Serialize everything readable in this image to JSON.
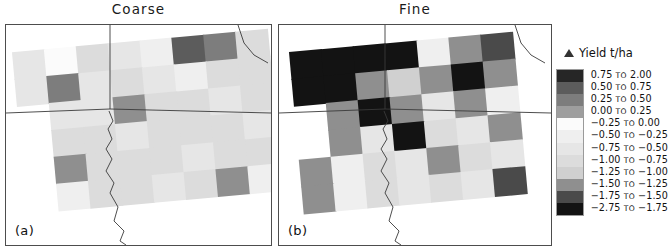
{
  "figure": {
    "panels": [
      {
        "id": "a",
        "title": "Coarse",
        "corner_label": "(a)"
      },
      {
        "id": "b",
        "title": "Fine",
        "corner_label": "(b)"
      }
    ]
  },
  "legend": {
    "symbol": "delta-triangle-icon",
    "title": "Yield t/ha",
    "separator": "to",
    "entries": [
      {
        "label": "0.75 to 2.00",
        "from": "0.75",
        "to": "2.00",
        "color": "#262626"
      },
      {
        "label": "0.50 to 0.75",
        "from": "0.50",
        "to": "0.75",
        "color": "#5c5c5c"
      },
      {
        "label": "0.25 to 0.50",
        "from": "0.25",
        "to": "0.50",
        "color": "#7d7d7d"
      },
      {
        "label": "0.00 to 0.25",
        "from": "0.00",
        "to": "0.25",
        "color": "#9e9e9e"
      },
      {
        "label": "-0.25 to 0.00",
        "from": "-0.25",
        "to": "0.00",
        "color": "#fbfbfb"
      },
      {
        "label": "-0.50 to -0.25",
        "from": "-0.50",
        "to": "-0.25",
        "color": "#efefef"
      },
      {
        "label": "-0.75 to -0.50",
        "from": "-0.75",
        "to": "-0.50",
        "color": "#e6e6e6"
      },
      {
        "label": "-1.00 to -0.75",
        "from": "-1.00",
        "to": "-0.75",
        "color": "#dcdcdc"
      },
      {
        "label": "-1.25 to -1.00",
        "from": "-1.25",
        "to": "-1.00",
        "color": "#d0d0d0"
      },
      {
        "label": "-1.50 to -1.25",
        "from": "-1.50",
        "to": "-1.25",
        "color": "#8f8f8f"
      },
      {
        "label": "-1.75 to -1.50",
        "from": "-1.75",
        "to": "-1.50",
        "color": "#4a4a4a"
      },
      {
        "label": "-2.75 to -1.75",
        "from": "-2.75",
        "to": "-1.75",
        "color": "#131313"
      }
    ]
  },
  "chart_data": {
    "type": "heatmap",
    "xlabel": "",
    "ylabel": "",
    "legend_title": "Yield t/ha",
    "units": "t/ha",
    "grid": false,
    "legend_position": "right",
    "value_bins": [
      [
        0.75,
        2.0
      ],
      [
        0.5,
        0.75
      ],
      [
        0.25,
        0.5
      ],
      [
        0.0,
        0.25
      ],
      [
        -0.25,
        0.0
      ],
      [
        -0.5,
        -0.25
      ],
      [
        -0.75,
        -0.5
      ],
      [
        -1.0,
        -0.75
      ],
      [
        -1.25,
        -1.0
      ],
      [
        -1.5,
        -1.25
      ],
      [
        -1.75,
        -1.5
      ],
      [
        -2.75,
        -1.75
      ]
    ],
    "panels": [
      {
        "name": "Coarse",
        "label": "(a)",
        "cell_w": 32,
        "cell_h": 27,
        "cells": [
          {
            "cx": 0,
            "cy": 0,
            "bin": 6
          },
          {
            "cx": 1,
            "cy": 0,
            "bin": 4
          },
          {
            "cx": 2,
            "cy": 0,
            "bin": 7
          },
          {
            "cx": 3,
            "cy": 0,
            "bin": 6
          },
          {
            "cx": 4,
            "cy": 0,
            "bin": 5
          },
          {
            "cx": 5,
            "cy": 0,
            "bin": 1
          },
          {
            "cx": 6,
            "cy": 0,
            "bin": 2
          },
          {
            "cx": 7,
            "cy": 0,
            "bin": 7
          },
          {
            "cx": 0,
            "cy": 1,
            "bin": 6
          },
          {
            "cx": 1,
            "cy": 1,
            "bin": 2
          },
          {
            "cx": 2,
            "cy": 1,
            "bin": 6
          },
          {
            "cx": 3,
            "cy": 1,
            "bin": 7
          },
          {
            "cx": 4,
            "cy": 1,
            "bin": 6
          },
          {
            "cx": 5,
            "cy": 1,
            "bin": 5
          },
          {
            "cx": 6,
            "cy": 1,
            "bin": 7
          },
          {
            "cx": 7,
            "cy": 1,
            "bin": 7
          },
          {
            "cx": 1,
            "cy": 2,
            "bin": 6
          },
          {
            "cx": 2,
            "cy": 2,
            "bin": 6
          },
          {
            "cx": 3,
            "cy": 2,
            "bin": 9
          },
          {
            "cx": 4,
            "cy": 2,
            "bin": 7
          },
          {
            "cx": 5,
            "cy": 2,
            "bin": 7
          },
          {
            "cx": 6,
            "cy": 2,
            "bin": 6
          },
          {
            "cx": 7,
            "cy": 2,
            "bin": 7
          },
          {
            "cx": 1,
            "cy": 3,
            "bin": 7
          },
          {
            "cx": 2,
            "cy": 3,
            "bin": 7
          },
          {
            "cx": 3,
            "cy": 3,
            "bin": 6
          },
          {
            "cx": 4,
            "cy": 3,
            "bin": 7
          },
          {
            "cx": 5,
            "cy": 3,
            "bin": 7
          },
          {
            "cx": 6,
            "cy": 3,
            "bin": 7
          },
          {
            "cx": 7,
            "cy": 3,
            "bin": 6
          },
          {
            "cx": 1,
            "cy": 4,
            "bin": 9
          },
          {
            "cx": 2,
            "cy": 4,
            "bin": 7
          },
          {
            "cx": 3,
            "cy": 4,
            "bin": 7
          },
          {
            "cx": 4,
            "cy": 4,
            "bin": 7
          },
          {
            "cx": 5,
            "cy": 4,
            "bin": 6
          },
          {
            "cx": 6,
            "cy": 4,
            "bin": 7
          },
          {
            "cx": 7,
            "cy": 4,
            "bin": 7
          },
          {
            "cx": 1,
            "cy": 5,
            "bin": 5
          },
          {
            "cx": 2,
            "cy": 5,
            "bin": 7
          },
          {
            "cx": 3,
            "cy": 5,
            "bin": 7
          },
          {
            "cx": 4,
            "cy": 5,
            "bin": 6
          },
          {
            "cx": 5,
            "cy": 5,
            "bin": 7
          },
          {
            "cx": 6,
            "cy": 5,
            "bin": 9
          },
          {
            "cx": 7,
            "cy": 5,
            "bin": 5
          }
        ]
      },
      {
        "name": "Fine",
        "label": "(b)",
        "cell_w": 32,
        "cell_h": 27,
        "cells": [
          {
            "cx": 0,
            "cy": 0,
            "bin": 11
          },
          {
            "cx": 1,
            "cy": 0,
            "bin": 11
          },
          {
            "cx": 2,
            "cy": 0,
            "bin": 11
          },
          {
            "cx": 3,
            "cy": 0,
            "bin": 11
          },
          {
            "cx": 4,
            "cy": 0,
            "bin": 5
          },
          {
            "cx": 5,
            "cy": 0,
            "bin": 9
          },
          {
            "cx": 6,
            "cy": 0,
            "bin": 10
          },
          {
            "cx": 0,
            "cy": 1,
            "bin": 11
          },
          {
            "cx": 1,
            "cy": 1,
            "bin": 11
          },
          {
            "cx": 2,
            "cy": 1,
            "bin": 9
          },
          {
            "cx": 3,
            "cy": 1,
            "bin": 8
          },
          {
            "cx": 4,
            "cy": 1,
            "bin": 9
          },
          {
            "cx": 5,
            "cy": 1,
            "bin": 11
          },
          {
            "cx": 6,
            "cy": 1,
            "bin": 9
          },
          {
            "cx": 1,
            "cy": 2,
            "bin": 9
          },
          {
            "cx": 2,
            "cy": 2,
            "bin": 11
          },
          {
            "cx": 3,
            "cy": 2,
            "bin": 9
          },
          {
            "cx": 4,
            "cy": 2,
            "bin": 6
          },
          {
            "cx": 5,
            "cy": 2,
            "bin": 9
          },
          {
            "cx": 6,
            "cy": 2,
            "bin": 5
          },
          {
            "cx": 1,
            "cy": 3,
            "bin": 9
          },
          {
            "cx": 2,
            "cy": 3,
            "bin": 6
          },
          {
            "cx": 3,
            "cy": 3,
            "bin": 11
          },
          {
            "cx": 4,
            "cy": 3,
            "bin": 7
          },
          {
            "cx": 5,
            "cy": 3,
            "bin": 6
          },
          {
            "cx": 6,
            "cy": 3,
            "bin": 9
          },
          {
            "cx": 0,
            "cy": 4,
            "bin": 9
          },
          {
            "cx": 1,
            "cy": 4,
            "bin": 5
          },
          {
            "cx": 2,
            "cy": 4,
            "bin": 7
          },
          {
            "cx": 3,
            "cy": 4,
            "bin": 6
          },
          {
            "cx": 4,
            "cy": 4,
            "bin": 9
          },
          {
            "cx": 5,
            "cy": 4,
            "bin": 7
          },
          {
            "cx": 6,
            "cy": 4,
            "bin": 6
          },
          {
            "cx": 0,
            "cy": 5,
            "bin": 9
          },
          {
            "cx": 1,
            "cy": 5,
            "bin": 5
          },
          {
            "cx": 2,
            "cy": 5,
            "bin": 7
          },
          {
            "cx": 3,
            "cy": 5,
            "bin": 6
          },
          {
            "cx": 4,
            "cy": 5,
            "bin": 7
          },
          {
            "cx": 5,
            "cy": 5,
            "bin": 6
          },
          {
            "cx": 6,
            "cy": 5,
            "bin": 10
          }
        ]
      }
    ]
  }
}
